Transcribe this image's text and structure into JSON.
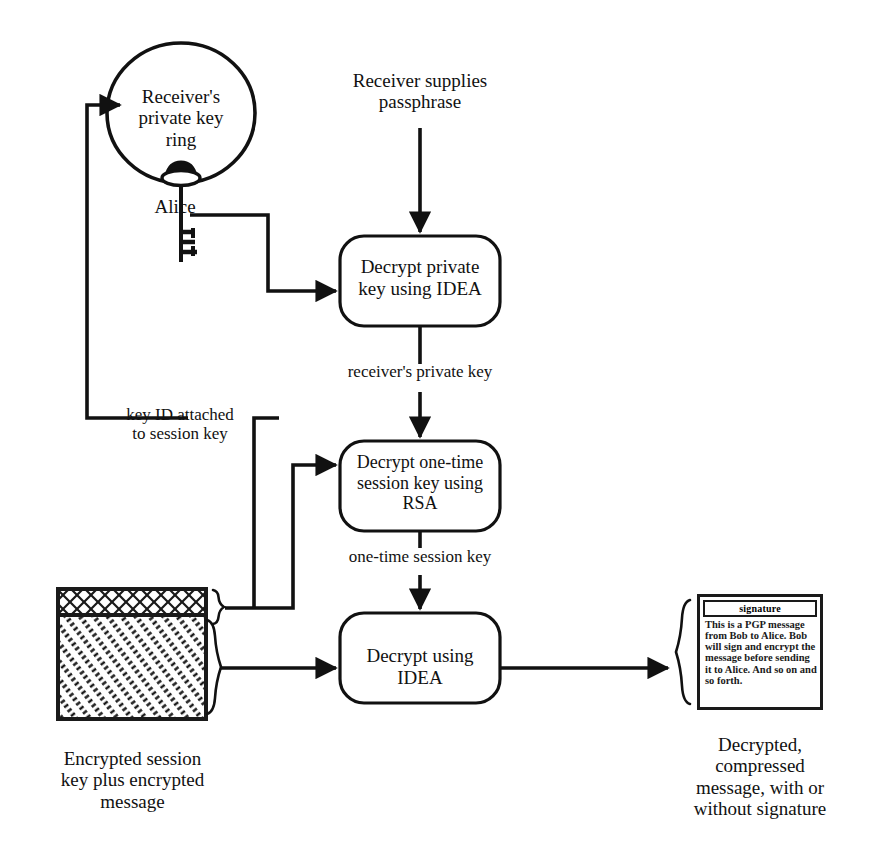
{
  "figure": {
    "type": "flow-diagram"
  },
  "keyring": {
    "label": "Receiver's\nprivate key\nring",
    "key_label": "Alice"
  },
  "inputs": {
    "passphrase": "Receiver supplies\npassphrase"
  },
  "processes": [
    {
      "id": "decrypt-private-key",
      "label": "Decrypt private\nkey using IDEA"
    },
    {
      "id": "decrypt-session-key",
      "label": "Decrypt one-time\nsession key using\nRSA"
    },
    {
      "id": "decrypt-message",
      "label": "Decrypt using\nIDEA"
    }
  ],
  "edge_labels": {
    "private_key": "receiver's private key",
    "key_id": "key ID attached\nto session key",
    "session_key": "one-time session key"
  },
  "encrypted_block": {
    "caption": "Encrypted session\nkey plus encrypted\nmessage",
    "top_segment_pattern": "crosshatch",
    "body_segment_pattern": "diagonal-hatch"
  },
  "output_document": {
    "signature_header": "signature",
    "body": "This is a PGP message from Bob to Alice. Bob will sign and encrypt the message before sending it to Alice. And so on and so forth.",
    "caption": "Decrypted,\ncompressed\nmessage, with or\nwithout signature"
  },
  "colors": {
    "stroke": "#111111",
    "background": "#ffffff",
    "text": "#111111"
  }
}
